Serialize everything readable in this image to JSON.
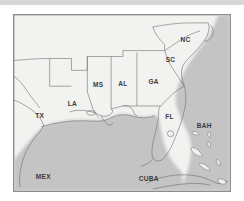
{
  "image": {
    "kind": "reference-map",
    "title_visible": false,
    "frame": {
      "border_color": "#8e8e8e",
      "background_color": "#f5f5f3"
    },
    "top_strip": {
      "color": "#d7d7d7"
    }
  },
  "colors": {
    "land": "#f2f2f0",
    "water": "#c4c4c4",
    "border": "#6d6d6d",
    "label": "#3a3a3a",
    "frame": "#8e8e8e",
    "strip": "#d7d7d7"
  },
  "map": {
    "region_description": "Southeastern United States and Gulf of Mexico",
    "labels": [
      {
        "id": "tx",
        "text": "TX",
        "x": 26,
        "y": 104,
        "size": "normal"
      },
      {
        "id": "la",
        "text": "LA",
        "x": 59,
        "y": 92,
        "size": "normal"
      },
      {
        "id": "ms",
        "text": "MS",
        "x": 85,
        "y": 73,
        "size": "normal"
      },
      {
        "id": "al",
        "text": "AL",
        "x": 110,
        "y": 72,
        "size": "normal"
      },
      {
        "id": "ga",
        "text": "GA",
        "x": 141,
        "y": 70,
        "size": "normal"
      },
      {
        "id": "sc",
        "text": "SC",
        "x": 158,
        "y": 48,
        "size": "normal"
      },
      {
        "id": "nc",
        "text": "NC",
        "x": 173,
        "y": 27,
        "size": "normal"
      },
      {
        "id": "fl",
        "text": "FL",
        "x": 157,
        "y": 105,
        "size": "normal"
      },
      {
        "id": "bah",
        "text": "BAH",
        "x": 192,
        "y": 114,
        "size": "normal"
      },
      {
        "id": "mex",
        "text": "MEX",
        "x": 22,
        "y": 166,
        "size": "normal"
      },
      {
        "id": "cuba",
        "text": "CUBA",
        "x": 126,
        "y": 168,
        "size": "normal"
      }
    ],
    "label_names": {
      "tx": "Texas",
      "la": "Louisiana",
      "ms": "Mississippi",
      "al": "Alabama",
      "ga": "Georgia",
      "sc": "South Carolina",
      "nc": "North Carolina",
      "fl": "Florida",
      "bah": "Bahamas",
      "mex": "Mexico",
      "cuba": "Cuba"
    },
    "features": [
      "Gulf of Mexico (shaded water body, center-left)",
      "Atlantic Ocean (shaded water, right side)",
      "Florida peninsula with Lake Okeechobee",
      "Mississippi River delta",
      "Bahamas island chain",
      "Cuba coastline along bottom"
    ]
  }
}
